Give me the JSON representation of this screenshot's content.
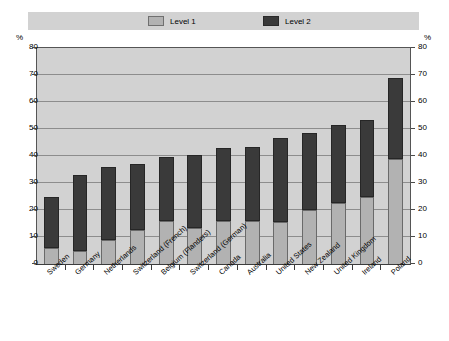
{
  "legend": {
    "entries": [
      {
        "label": "Level 1",
        "swatch": "legend-swatch-level1",
        "color": "#b2b2b2"
      },
      {
        "label": "Level 2",
        "swatch": "legend-swatch-level2",
        "color": "#3a3a3a"
      }
    ]
  },
  "axis": {
    "unit_left": "%",
    "unit_right": "%",
    "ticks": [
      "0",
      "10",
      "20",
      "30",
      "40",
      "50",
      "60",
      "70",
      "80"
    ]
  },
  "chart_data": {
    "type": "bar",
    "title": "",
    "subtitle": "",
    "xlabel": "",
    "ylabel": "%",
    "ylim": [
      0,
      80
    ],
    "ytick_step": 10,
    "grid": true,
    "stacked": true,
    "legend_position": "top",
    "categories": [
      "Sweden",
      "Germany",
      "Netherlands",
      "Switzerland (French)",
      "Belgium (Flanders)",
      "Switzerland (German)",
      "Canada",
      "Australia",
      "United States",
      "New Zealand",
      "United Kingdom",
      "Ireland",
      "Poland"
    ],
    "series": [
      {
        "name": "Level 1",
        "color": "#b2b2b2",
        "values": [
          6,
          5,
          9,
          12.5,
          16,
          13.5,
          16,
          16,
          15.5,
          20,
          22.5,
          25,
          39
        ]
      },
      {
        "name": "Level 2",
        "color": "#3a3a3a",
        "values": [
          19,
          28,
          27,
          24.5,
          23.5,
          27,
          27,
          27.5,
          31,
          28.5,
          29,
          28.5,
          30
        ]
      }
    ],
    "totals": [
      25,
      33,
      36,
      37,
      39.5,
      40.5,
      43,
      43.5,
      46.5,
      48.5,
      51.5,
      53.5,
      69
    ],
    "colors": {
      "plot_background": "#d2d2d2",
      "gridline": "#8d8d8d",
      "axis": "#3c3c3c",
      "page_background": "#ffffff"
    }
  }
}
